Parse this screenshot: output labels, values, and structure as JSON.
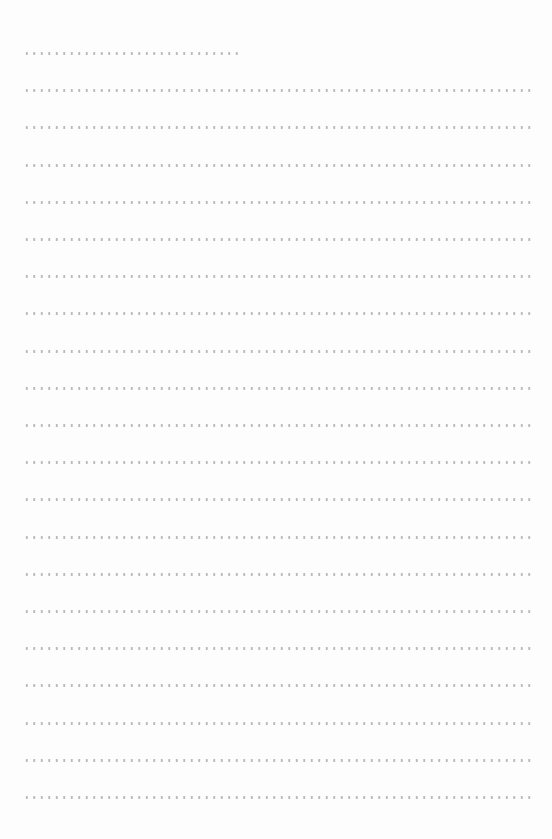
{
  "document": {
    "type": "dotted-line writing form",
    "line_color": "#b9b9b9",
    "background_color": "#fdfdfd",
    "lines": [
      {
        "kind": "short",
        "y": 53,
        "width": 218
      },
      {
        "kind": "full",
        "y": 90,
        "width": 508
      },
      {
        "kind": "full",
        "y": 129,
        "width": 508
      },
      {
        "kind": "full",
        "y": 167,
        "width": 508
      },
      {
        "kind": "full",
        "y": 205,
        "width": 508
      },
      {
        "kind": "full",
        "y": 243,
        "width": 508
      },
      {
        "kind": "full",
        "y": 281,
        "width": 508
      },
      {
        "kind": "full",
        "y": 318,
        "width": 508
      },
      {
        "kind": "full",
        "y": 356,
        "width": 508
      },
      {
        "kind": "full",
        "y": 394,
        "width": 508
      },
      {
        "kind": "full",
        "y": 432,
        "width": 508
      },
      {
        "kind": "full",
        "y": 470,
        "width": 508
      },
      {
        "kind": "full",
        "y": 508,
        "width": 508
      },
      {
        "kind": "full",
        "y": 546,
        "width": 508
      },
      {
        "kind": "full",
        "y": 584,
        "width": 508
      },
      {
        "kind": "full",
        "y": 622,
        "width": 508
      },
      {
        "kind": "full",
        "y": 660,
        "width": 508
      },
      {
        "kind": "full",
        "y": 698,
        "width": 508
      },
      {
        "kind": "full",
        "y": 736,
        "width": 508
      },
      {
        "kind": "full",
        "y": 759,
        "width": 508
      },
      {
        "kind": "full",
        "y": 797,
        "width": 508
      }
    ]
  }
}
